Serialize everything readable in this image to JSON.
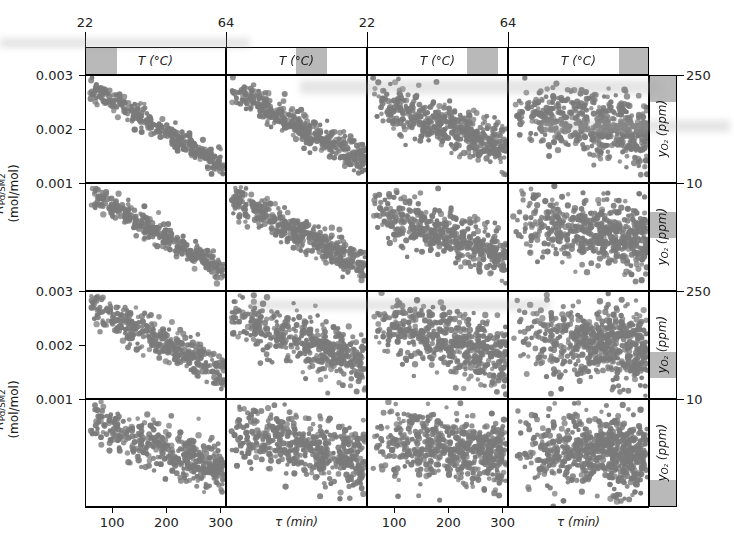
{
  "figure": {
    "type": "scatter-matrix",
    "dot_color": "#7a7a7a",
    "strip_band_color": "#b9b9b9",
    "axis_color": "#000000"
  },
  "axes": {
    "x_bottom": {
      "label": "τ (min)",
      "ticks": [
        "100",
        "200",
        "300"
      ],
      "tick_values": [
        100,
        200,
        300
      ],
      "range": [
        50,
        310
      ]
    },
    "x_top": {
      "label": "T (°C)",
      "ticks": [
        "22",
        "64"
      ],
      "tick_values": [
        22,
        64
      ]
    },
    "y_left": {
      "label_main": "R",
      "label_sub": "Pd/SM2",
      "label_units": "(mol/mol)",
      "ticks": [
        "0.003",
        "0.002",
        "0.001"
      ],
      "tick_values": [
        0.003,
        0.002,
        0.001
      ],
      "range": [
        0.0008,
        0.0032
      ]
    },
    "y_right": {
      "label_main": "y",
      "label_sub": "O₂",
      "label_units": "(ppm)",
      "ticks": [
        "250",
        "10"
      ],
      "tick_values": [
        250,
        10
      ]
    }
  },
  "strips": {
    "top_label": "T (°C)",
    "right_label_main": "y",
    "right_label_sub": "O₂",
    "right_label_units": "(ppm)",
    "top_bands": [
      {
        "left_frac": 0.0,
        "width_frac": 0.22
      },
      {
        "left_frac": 0.49,
        "width_frac": 0.22
      },
      {
        "left_frac": 0.7,
        "width_frac": 0.22
      },
      {
        "left_frac": 0.78,
        "width_frac": 0.22
      }
    ],
    "right_bands": [
      {
        "top_frac": 0.0,
        "height_frac": 0.24
      },
      {
        "top_frac": 0.26,
        "height_frac": 0.24
      },
      {
        "top_frac": 0.56,
        "height_frac": 0.24
      },
      {
        "top_frac": 0.74,
        "height_frac": 0.26
      }
    ]
  },
  "grid": {
    "rows": 4,
    "cols": 4,
    "col_edges": [
      85,
      226,
      367,
      508,
      649
    ],
    "row_edges": [
      75,
      183,
      291,
      399,
      507
    ],
    "strip_top_y": 47,
    "strip_top_h": 28,
    "strip_right_x": 649,
    "strip_right_w": 28
  },
  "chart_data": {
    "type": "scatter",
    "title": "",
    "xlabel": "τ (min)",
    "ylabel": "R_Pd/SM2 (mol/mol)",
    "xlabel_top": "T (°C)",
    "ylabel_right": "y_O2 (ppm)",
    "xlim": [
      50,
      310
    ],
    "ylim": [
      0.0008,
      0.0032
    ],
    "xticks": [
      100,
      200,
      300
    ],
    "yticks": [
      0.001,
      0.002,
      0.003
    ],
    "xticks_top": [
      22,
      64
    ],
    "yticks_right": [
      10,
      250
    ],
    "grid": false,
    "legend": null,
    "conditioning": {
      "columns_variable": "T (°C)",
      "rows_variable": "y_O2 (ppm)",
      "note": "Conditioning strips shade the sub-range of T (columns) and y_O2 (rows) for each panel."
    },
    "panels": [
      {
        "row": 0,
        "col": 0,
        "n": 320,
        "slope": -1.0,
        "spread": 0.16,
        "intercept": 0.92,
        "xskew": 0.0,
        "seed": 11,
        "description": "tight negative diagonal band, high R at low tau"
      },
      {
        "row": 0,
        "col": 1,
        "n": 380,
        "slope": -0.92,
        "spread": 0.22,
        "intercept": 0.9,
        "xskew": 0.05,
        "seed": 12,
        "description": "negative diagonal band, wider"
      },
      {
        "row": 0,
        "col": 2,
        "n": 430,
        "slope": -0.62,
        "spread": 0.32,
        "intercept": 0.8,
        "xskew": 0.12,
        "seed": 13,
        "description": "diffuse negative trend"
      },
      {
        "row": 0,
        "col": 3,
        "n": 520,
        "slope": -0.3,
        "spread": 0.42,
        "intercept": 0.68,
        "xskew": 0.22,
        "seed": 14,
        "description": "dense, nearly uncorrelated cloud"
      },
      {
        "row": 1,
        "col": 0,
        "n": 330,
        "slope": -0.98,
        "spread": 0.17,
        "intercept": 0.93,
        "xskew": 0.0,
        "seed": 21,
        "description": "tight negative diagonal band"
      },
      {
        "row": 1,
        "col": 1,
        "n": 400,
        "slope": -0.88,
        "spread": 0.24,
        "intercept": 0.9,
        "xskew": 0.06,
        "seed": 22,
        "description": "negative diagonal, broader"
      },
      {
        "row": 1,
        "col": 2,
        "n": 450,
        "slope": -0.58,
        "spread": 0.34,
        "intercept": 0.78,
        "xskew": 0.14,
        "seed": 23,
        "description": "diffuse negative trend"
      },
      {
        "row": 1,
        "col": 3,
        "n": 540,
        "slope": -0.26,
        "spread": 0.44,
        "intercept": 0.66,
        "xskew": 0.24,
        "seed": 24,
        "description": "dense cloud filling panel"
      },
      {
        "row": 2,
        "col": 0,
        "n": 360,
        "slope": -0.8,
        "spread": 0.26,
        "intercept": 0.88,
        "xskew": 0.06,
        "seed": 31,
        "description": "negative trend, moderate scatter"
      },
      {
        "row": 2,
        "col": 1,
        "n": 440,
        "slope": -0.62,
        "spread": 0.34,
        "intercept": 0.8,
        "xskew": 0.14,
        "seed": 32,
        "description": "diffuse negative trend"
      },
      {
        "row": 2,
        "col": 2,
        "n": 490,
        "slope": -0.4,
        "spread": 0.42,
        "intercept": 0.72,
        "xskew": 0.2,
        "seed": 33,
        "description": "broad cloud, weak trend"
      },
      {
        "row": 2,
        "col": 3,
        "n": 570,
        "slope": -0.16,
        "spread": 0.48,
        "intercept": 0.62,
        "xskew": 0.28,
        "seed": 34,
        "description": "very dense, fills panel"
      },
      {
        "row": 3,
        "col": 0,
        "n": 400,
        "slope": -0.66,
        "spread": 0.32,
        "intercept": 0.84,
        "xskew": 0.1,
        "seed": 41,
        "description": "negative trend, wide scatter"
      },
      {
        "row": 3,
        "col": 1,
        "n": 480,
        "slope": -0.46,
        "spread": 0.4,
        "intercept": 0.76,
        "xskew": 0.18,
        "seed": 42,
        "description": "broad cloud, weak trend"
      },
      {
        "row": 3,
        "col": 2,
        "n": 540,
        "slope": -0.26,
        "spread": 0.46,
        "intercept": 0.68,
        "xskew": 0.24,
        "seed": 43,
        "description": "dense cloud"
      },
      {
        "row": 3,
        "col": 3,
        "n": 610,
        "slope": -0.08,
        "spread": 0.5,
        "intercept": 0.58,
        "xskew": 0.3,
        "seed": 44,
        "description": "saturated cloud, no visible trend"
      }
    ]
  }
}
